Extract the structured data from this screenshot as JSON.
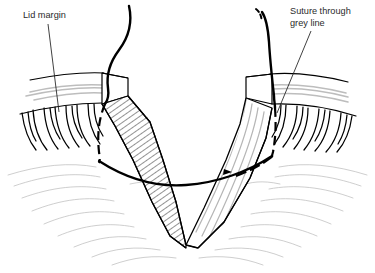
{
  "figure": {
    "name": "eyelid-v-wound-suture-diagram",
    "background_color": "#ffffff",
    "ink_color": "#000000",
    "text_color": "#2b2b2b",
    "shade_color": "#a8a8a8",
    "hatch_color": "#1a1a1a"
  },
  "labels": {
    "lid_margin": {
      "text": "Lid margin",
      "x": 23,
      "y": 18,
      "leader_from_x": 48,
      "leader_from_y": 24,
      "leader_to_x": 59,
      "leader_to_y": 112
    },
    "suture_line1": {
      "text": "Suture through",
      "x": 290,
      "y": 14
    },
    "suture_line2": {
      "text": "grey line",
      "x": 290,
      "y": 26,
      "leader_from_x": 311,
      "leader_from_y": 31,
      "leader_to_x": 277,
      "leader_to_y": 113
    }
  },
  "parts": {
    "left_lid_block": "left-cut-edge-block",
    "right_lid_block": "right-cut-edge-block",
    "wound": "v-shaped-full-thickness-defect",
    "hatching": "cut-surface-hatching",
    "left_lashes_count": 11,
    "right_lashes_count": 11,
    "left_suture_thread": "left-suture-thread",
    "right_suture_thread": "right-suture-thread",
    "suture_arc": "suture-crossing-arc"
  }
}
